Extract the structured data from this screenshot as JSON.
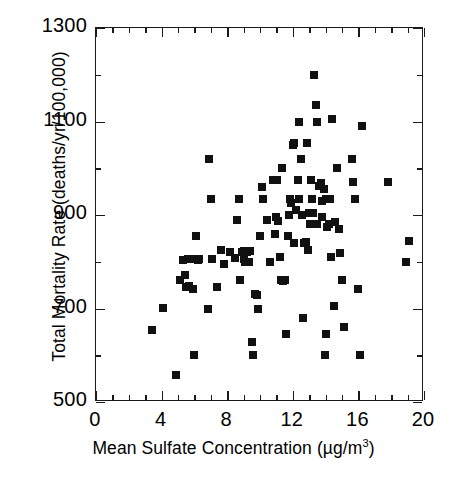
{
  "chart_data": {
    "type": "scatter",
    "title": "",
    "xlabel": "Mean Sulfate Concentration (µg/m³)",
    "xlabel_main": "Mean Sulfate Concentration (µg/m",
    "xlabel_sup": "3",
    "xlabel_tail": ")",
    "ylabel": "Total Mortality Rate  (deaths/yr/100,000)",
    "xlim": [
      0,
      20
    ],
    "ylim": [
      500,
      1300
    ],
    "xticks": [
      0,
      4,
      8,
      12,
      16,
      20
    ],
    "xtick_labels": [
      "0",
      "4",
      "8",
      "12",
      "16",
      "20"
    ],
    "xminor_step": 1,
    "yticks": [
      500,
      700,
      900,
      1100,
      1300
    ],
    "ytick_labels": [
      "500",
      "700",
      "900",
      "1100",
      "1300"
    ],
    "yminor_step": 100,
    "grid": false,
    "legend": "none",
    "marker": "square",
    "marker_color": "#111111",
    "marker_size_px": 8,
    "frame": "box",
    "tick_direction": "in",
    "series_name": "cities",
    "points": [
      [
        3.4,
        655
      ],
      [
        4.1,
        702
      ],
      [
        4.9,
        558
      ],
      [
        5.1,
        760
      ],
      [
        5.3,
        803
      ],
      [
        5.4,
        772
      ],
      [
        5.5,
        745
      ],
      [
        5.6,
        805
      ],
      [
        5.7,
        748
      ],
      [
        5.8,
        805
      ],
      [
        5.9,
        742
      ],
      [
        6.0,
        600
      ],
      [
        6.1,
        855
      ],
      [
        6.2,
        803
      ],
      [
        6.3,
        805
      ],
      [
        6.8,
        700
      ],
      [
        6.9,
        1020
      ],
      [
        7.0,
        935
      ],
      [
        7.4,
        745
      ],
      [
        7.6,
        825
      ],
      [
        7.8,
        795
      ],
      [
        8.5,
        808
      ],
      [
        8.6,
        890
      ],
      [
        8.7,
        935
      ],
      [
        8.8,
        760
      ],
      [
        8.9,
        820
      ],
      [
        9.0,
        823
      ],
      [
        9.1,
        800
      ],
      [
        9.2,
        820
      ],
      [
        9.3,
        800
      ],
      [
        9.4,
        822
      ],
      [
        9.5,
        628
      ],
      [
        9.6,
        600
      ],
      [
        9.7,
        730
      ],
      [
        9.8,
        728
      ],
      [
        10.0,
        855
      ],
      [
        10.1,
        960
      ],
      [
        10.2,
        935
      ],
      [
        10.6,
        800
      ],
      [
        10.8,
        975
      ],
      [
        11.0,
        895
      ],
      [
        11.1,
        888
      ],
      [
        11.2,
        810
      ],
      [
        11.3,
        760
      ],
      [
        11.4,
        758
      ],
      [
        11.5,
        760
      ],
      [
        11.6,
        645
      ],
      [
        11.7,
        855
      ],
      [
        11.8,
        935
      ],
      [
        11.9,
        925
      ],
      [
        12.0,
        1050
      ],
      [
        12.1,
        1055
      ],
      [
        12.2,
        910
      ],
      [
        12.3,
        975
      ],
      [
        12.4,
        1100
      ],
      [
        12.5,
        1020
      ],
      [
        12.6,
        680
      ],
      [
        12.7,
        840
      ],
      [
        12.8,
        842
      ],
      [
        12.9,
        825
      ],
      [
        13.0,
        905
      ],
      [
        13.1,
        975
      ],
      [
        13.2,
        935
      ],
      [
        13.3,
        1200
      ],
      [
        13.4,
        1135
      ],
      [
        13.5,
        1100
      ],
      [
        13.6,
        962
      ],
      [
        13.7,
        968
      ],
      [
        13.8,
        930
      ],
      [
        13.9,
        955
      ],
      [
        13.95,
        600
      ],
      [
        14.0,
        645
      ],
      [
        14.1,
        875
      ],
      [
        14.2,
        880
      ],
      [
        14.3,
        810
      ],
      [
        14.4,
        1105
      ],
      [
        14.5,
        705
      ],
      [
        14.6,
        885
      ],
      [
        14.7,
        1000
      ],
      [
        14.8,
        870
      ],
      [
        14.9,
        818
      ],
      [
        15.0,
        760
      ],
      [
        15.1,
        660
      ],
      [
        15.6,
        1020
      ],
      [
        15.7,
        970
      ],
      [
        15.8,
        935
      ],
      [
        16.0,
        742
      ],
      [
        16.1,
        600
      ],
      [
        16.2,
        1090
      ],
      [
        17.8,
        970
      ],
      [
        18.9,
        800
      ],
      [
        19.1,
        845
      ],
      [
        7.1,
        805
      ],
      [
        8.2,
        820
      ],
      [
        9.9,
        700
      ],
      [
        11.05,
        975
      ],
      [
        12.05,
        840
      ],
      [
        13.05,
        880
      ],
      [
        10.4,
        890
      ],
      [
        12.55,
        900
      ],
      [
        13.45,
        880
      ],
      [
        14.05,
        935
      ],
      [
        11.35,
        1000
      ],
      [
        12.85,
        1055
      ],
      [
        9.05,
        805
      ],
      [
        5.95,
        805
      ],
      [
        13.25,
        905
      ],
      [
        12.35,
        935
      ],
      [
        14.25,
        935
      ],
      [
        11.75,
        900
      ],
      [
        13.75,
        895
      ],
      [
        10.9,
        860
      ]
    ]
  }
}
